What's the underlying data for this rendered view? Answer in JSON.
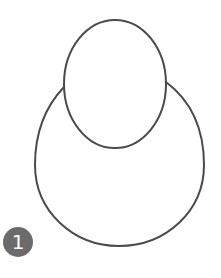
{
  "figure": {
    "stroke_color": "#4a4a4a",
    "background": "#ffffff",
    "head": {
      "cx": 115,
      "cy": 84,
      "rx": 51,
      "ry": 64
    },
    "body": {
      "cx": 119,
      "cy": 165,
      "rx": 85,
      "ry": 82
    }
  },
  "badge": {
    "label": "1",
    "bg_color": "#6b6b6b",
    "text_color": "#ffffff"
  }
}
